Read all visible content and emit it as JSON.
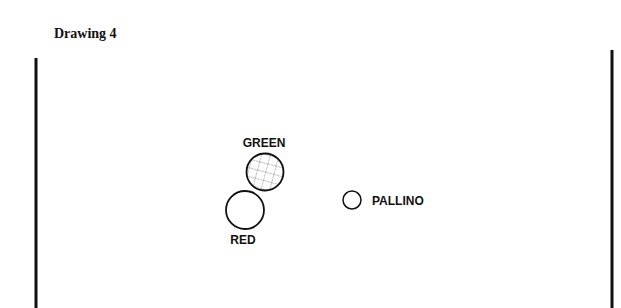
{
  "title": "Drawing 4",
  "balls": {
    "green": {
      "label": "GREEN",
      "pattern": "herringbone-hatch"
    },
    "red": {
      "label": "RED",
      "pattern": "none"
    },
    "pallino": {
      "label": "PALLINO"
    }
  },
  "colors": {
    "stroke": "#111111",
    "hatch": "#aaaaaa",
    "background": "#ffffff"
  }
}
